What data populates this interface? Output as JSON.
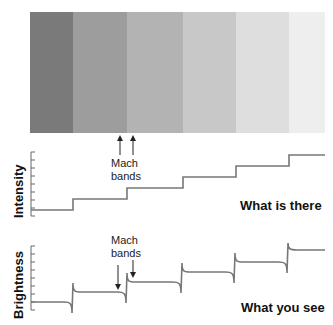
{
  "bands": [
    {
      "x": 30,
      "w": 43,
      "color": "#7a7a7a"
    },
    {
      "x": 73,
      "w": 54,
      "color": "#9d9d9d"
    },
    {
      "x": 127,
      "w": 56,
      "color": "#b3b3b3"
    },
    {
      "x": 183,
      "w": 53,
      "color": "#c8c8c8"
    },
    {
      "x": 236,
      "w": 53,
      "color": "#dedede"
    },
    {
      "x": 289,
      "w": 36,
      "color": "#eeeeee"
    }
  ],
  "top_arrows_label": {
    "line1": "Mach",
    "line2": "bands"
  },
  "intensity": {
    "axis_label": "Intensity",
    "caption": "What is there"
  },
  "brightness": {
    "axis_label": "Brightness",
    "caption": "What you see",
    "mach_label_line1": "Mach",
    "mach_label_line2": "bands"
  },
  "chart_data": [
    {
      "type": "line",
      "title": "What is there",
      "ylabel": "Intensity",
      "x": [
        0,
        1,
        2,
        3,
        4,
        5
      ],
      "values": [
        1,
        2,
        3,
        4,
        5,
        6
      ],
      "description": "Staircase luminance profile"
    },
    {
      "type": "line",
      "title": "What you see",
      "ylabel": "Brightness",
      "x": [
        0,
        1,
        2,
        3,
        4,
        5
      ],
      "values": [
        1,
        2,
        3,
        4,
        5,
        6
      ],
      "description": "Staircase with overshoot/undershoot (Mach bands) at each edge"
    }
  ]
}
